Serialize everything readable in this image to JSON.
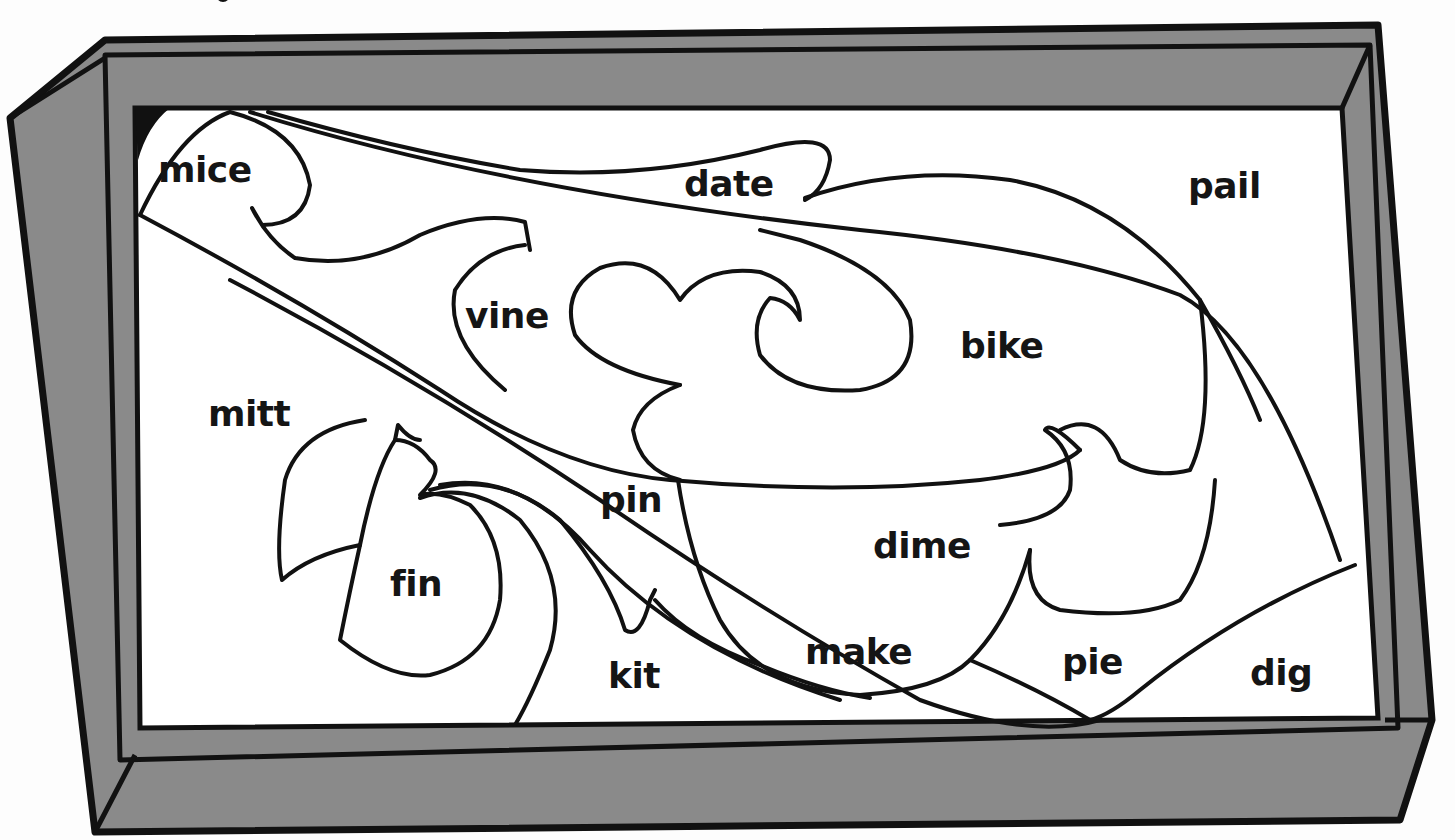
{
  "worksheet": {
    "type": "color-by-word puzzle picture",
    "colors": {
      "frame": "#8a8a8a",
      "outline": "#111111",
      "panel": "#ffffff"
    },
    "words": [
      {
        "id": "mice",
        "label": "mice",
        "x": 158,
        "y": 152
      },
      {
        "id": "date",
        "label": "date",
        "x": 684,
        "y": 166
      },
      {
        "id": "pail",
        "label": "pail",
        "x": 1188,
        "y": 168
      },
      {
        "id": "vine",
        "label": "vine",
        "x": 465,
        "y": 298
      },
      {
        "id": "bike",
        "label": "bike",
        "x": 960,
        "y": 328
      },
      {
        "id": "mitt",
        "label": "mitt",
        "x": 208,
        "y": 396
      },
      {
        "id": "pin",
        "label": "pin",
        "x": 600,
        "y": 482
      },
      {
        "id": "dime",
        "label": "dime",
        "x": 873,
        "y": 528
      },
      {
        "id": "fin",
        "label": "fin",
        "x": 390,
        "y": 566
      },
      {
        "id": "make",
        "label": "make",
        "x": 805,
        "y": 634
      },
      {
        "id": "pie",
        "label": "pie",
        "x": 1062,
        "y": 644
      },
      {
        "id": "kit",
        "label": "kit",
        "x": 608,
        "y": 658
      },
      {
        "id": "dig",
        "label": "dig",
        "x": 1250,
        "y": 655
      }
    ]
  }
}
